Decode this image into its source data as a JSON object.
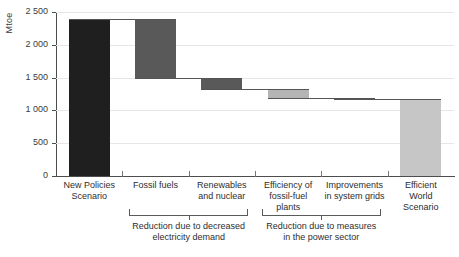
{
  "chart_data": {
    "type": "bar",
    "subtype": "waterfall",
    "title": "",
    "xlabel": "",
    "ylabel": "Mtoe",
    "ylim": [
      0,
      2500
    ],
    "yticks": [
      0,
      500,
      1000,
      1500,
      2000,
      2500
    ],
    "ytick_labels": [
      "0",
      "500",
      "1 000",
      "1 500",
      "2 000",
      "2 500"
    ],
    "grid": true,
    "legend": "none",
    "categories": [
      "New Policies\nScenario",
      "Fossil fuels",
      "Renewables\nand nuclear",
      "Efficiency of\nfossil-fuel\nplants",
      "Improvements\nin system grids",
      "Efficient\nWorld\nScenario"
    ],
    "values": [
      2400,
      -900,
      -175,
      -130,
      -25,
      1180
    ],
    "cumulative_tops": [
      2400,
      2400,
      1500,
      1325,
      1195,
      1180
    ],
    "cumulative_bottoms": [
      0,
      1500,
      1325,
      1195,
      1170,
      0
    ],
    "bar_colors": [
      "#1f1f1f",
      "#595959",
      "#595959",
      "#b4b4b4",
      "#808080",
      "#c6c6c6"
    ],
    "annotations": [
      {
        "text": "Reduction due to decreased\nelectricity demand",
        "spans": [
          "Fossil fuels",
          "Renewables and nuclear"
        ]
      },
      {
        "text": "Reduction due to measures\nin the power sector",
        "spans": [
          "Efficiency of fossil-fuel plants",
          "Improvements in system grids"
        ]
      }
    ]
  },
  "axis": {
    "y_title": "Mtoe"
  }
}
